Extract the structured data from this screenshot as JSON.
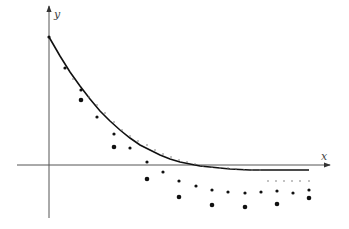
{
  "chart_data": {
    "type": "line",
    "title": "",
    "xlabel": "x",
    "ylabel": "y",
    "grid": false,
    "legend": null,
    "axes": {
      "origin_px": [
        49,
        165
      ],
      "x_axis_px": {
        "start": 17,
        "end": 330
      },
      "y_axis_px": {
        "top": 6,
        "bottom": 218
      }
    },
    "series": [
      {
        "name": "exact-solution-curve",
        "style": "solid-line",
        "points_px": [
          [
            49,
            37
          ],
          [
            60,
            56
          ],
          [
            70,
            72
          ],
          [
            80,
            86
          ],
          [
            90,
            99
          ],
          [
            100,
            111
          ],
          [
            110,
            121
          ],
          [
            120,
            130
          ],
          [
            130,
            138
          ],
          [
            140,
            145
          ],
          [
            150,
            150
          ],
          [
            160,
            155
          ],
          [
            170,
            159
          ],
          [
            180,
            162
          ],
          [
            190,
            164
          ],
          [
            200,
            166
          ],
          [
            210,
            167
          ],
          [
            220,
            168
          ],
          [
            230,
            169
          ],
          [
            240,
            169.5
          ],
          [
            250,
            170
          ],
          [
            260,
            170
          ],
          [
            270,
            170
          ],
          [
            280,
            170
          ],
          [
            290,
            170
          ],
          [
            300,
            170
          ],
          [
            309,
            170
          ]
        ]
      },
      {
        "name": "approximation-small-step",
        "style": "tiny-dots",
        "radius": 0.8,
        "points_px": [
          [
            73,
            79
          ],
          [
            89,
            97
          ],
          [
            97,
            105
          ],
          [
            105,
            113
          ],
          [
            114,
            122
          ],
          [
            122,
            130
          ],
          [
            130,
            136
          ],
          [
            138,
            141
          ],
          [
            147,
            145
          ],
          [
            155,
            150
          ],
          [
            163,
            154
          ],
          [
            171,
            157
          ],
          [
            179,
            160
          ],
          [
            187,
            162
          ],
          [
            195,
            164
          ],
          [
            203,
            166
          ],
          [
            212,
            167
          ],
          [
            220,
            168
          ],
          [
            228,
            168
          ],
          [
            236,
            169
          ],
          [
            244,
            170
          ],
          [
            252,
            170
          ],
          [
            260,
            170
          ],
          [
            268,
            181
          ],
          [
            276,
            181
          ],
          [
            284,
            181
          ],
          [
            292,
            181
          ],
          [
            300,
            181
          ],
          [
            309,
            181
          ]
        ]
      },
      {
        "name": "approximation-medium-step",
        "style": "medium-dots",
        "radius": 1.6,
        "points_px": [
          [
            49,
            37
          ],
          [
            65,
            68
          ],
          [
            81,
            90
          ],
          [
            97,
            117
          ],
          [
            114,
            134
          ],
          [
            130,
            148
          ],
          [
            147,
            162
          ],
          [
            163,
            172
          ],
          [
            179,
            181
          ],
          [
            196,
            186
          ],
          [
            212,
            190
          ],
          [
            228,
            192
          ],
          [
            245,
            193
          ],
          [
            261,
            192
          ],
          [
            277,
            191
          ],
          [
            293,
            193
          ],
          [
            309,
            190
          ]
        ]
      },
      {
        "name": "approximation-large-step",
        "style": "large-dots",
        "radius": 2.3,
        "points_px": [
          [
            81,
            100
          ],
          [
            114,
            147
          ],
          [
            147,
            179
          ],
          [
            179,
            197
          ],
          [
            212,
            205
          ],
          [
            245,
            207
          ],
          [
            277,
            204
          ],
          [
            309,
            198
          ]
        ]
      }
    ]
  },
  "labels": {
    "x_axis": "x",
    "y_axis": "y"
  }
}
